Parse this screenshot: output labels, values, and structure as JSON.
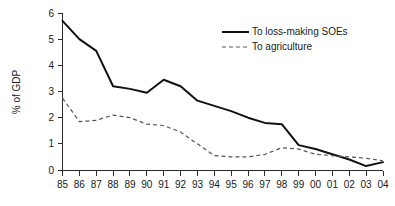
{
  "chart_data": {
    "type": "line",
    "title": "",
    "xlabel": "",
    "ylabel": "% of GDP",
    "x": [
      "85",
      "86",
      "87",
      "88",
      "89",
      "90",
      "91",
      "92",
      "93",
      "94",
      "95",
      "96",
      "97",
      "98",
      "99",
      "00",
      "01",
      "02",
      "03",
      "04"
    ],
    "categories": [
      "85",
      "86",
      "87",
      "88",
      "89",
      "90",
      "91",
      "92",
      "93",
      "94",
      "95",
      "96",
      "97",
      "98",
      "99",
      "00",
      "01",
      "02",
      "03",
      "04"
    ],
    "ylim": [
      0,
      6
    ],
    "xlim_labels": [
      "85",
      "04"
    ],
    "yticks": [
      0,
      1,
      2,
      3,
      4,
      5,
      6
    ],
    "ytick_labels": [
      "0",
      "1",
      "2",
      "3",
      "4",
      "5",
      "6"
    ],
    "grid": false,
    "legend_position": "top-right",
    "series": [
      {
        "name": "To loss-making SOEs",
        "style": "solid",
        "color": "#111111",
        "values": [
          5.7,
          5.0,
          4.55,
          3.2,
          3.1,
          2.95,
          3.45,
          3.2,
          2.65,
          2.45,
          2.25,
          2.0,
          1.8,
          1.75,
          0.95,
          0.8,
          0.6,
          0.4,
          0.15,
          0.3
        ]
      },
      {
        "name": "To agriculture",
        "style": "dashed",
        "color": "#555555",
        "values": [
          2.75,
          1.85,
          1.9,
          2.1,
          2.0,
          1.75,
          1.7,
          1.45,
          1.0,
          0.55,
          0.5,
          0.5,
          0.6,
          0.85,
          0.8,
          0.6,
          0.55,
          0.5,
          0.45,
          0.35
        ]
      }
    ]
  },
  "legend": {
    "items": [
      {
        "label": "To loss-making SOEs",
        "style": "solid"
      },
      {
        "label": "To agriculture",
        "style": "dashed"
      }
    ]
  }
}
